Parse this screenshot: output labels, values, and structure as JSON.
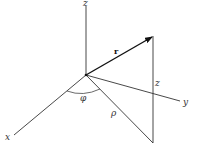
{
  "figure": {
    "labels": {
      "z_axis": "z",
      "x_axis": "x",
      "y_axis": "y",
      "vector": "r",
      "height": "z",
      "radial": "ρ",
      "angle": "φ"
    }
  }
}
